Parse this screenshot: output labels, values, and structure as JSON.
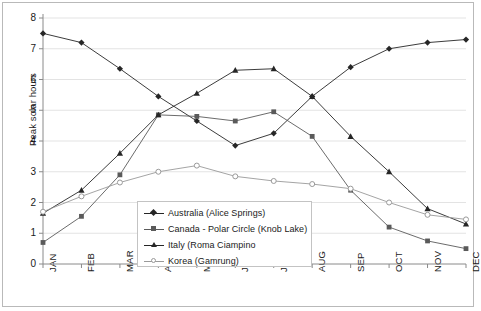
{
  "chart_data": {
    "type": "line",
    "title": "",
    "xlabel": "",
    "ylabel": "Peak solar hours",
    "categories": [
      "JAN",
      "FEB",
      "MAR",
      "APR",
      "MAY",
      "JUN",
      "JUL",
      "AUG",
      "SEP",
      "OCT",
      "NOV",
      "DEC"
    ],
    "ylim": [
      0,
      8
    ],
    "yticks": [
      0,
      1,
      2,
      3,
      4,
      5,
      6,
      7,
      8
    ],
    "grid": true,
    "legend_position": "inside-center-bottom",
    "series": [
      {
        "name": "Australia (Alice Springs)",
        "marker": "diamond",
        "color": "#262626",
        "values": [
          7.5,
          7.2,
          6.35,
          5.45,
          4.65,
          3.85,
          4.25,
          5.45,
          6.4,
          7.0,
          7.2,
          7.3
        ]
      },
      {
        "name": "Canada - Polar Circle (Knob Lake)",
        "marker": "square",
        "color": "#5a5a5a",
        "values": [
          0.7,
          1.55,
          2.9,
          4.85,
          4.8,
          4.65,
          4.95,
          4.15,
          2.4,
          1.2,
          0.75,
          0.5
        ]
      },
      {
        "name": "Italy (Roma Ciampino)",
        "marker": "triangle",
        "color": "#262626",
        "values": [
          1.65,
          2.4,
          3.6,
          4.85,
          5.55,
          6.3,
          6.35,
          5.45,
          4.15,
          3.0,
          1.8,
          1.3
        ]
      },
      {
        "name": "Korea (Gamrung)",
        "marker": "circle",
        "color": "#9a9a9a",
        "values": [
          1.7,
          2.2,
          2.65,
          3.0,
          3.2,
          2.85,
          2.7,
          2.6,
          2.45,
          2.0,
          1.6,
          1.45
        ]
      }
    ]
  },
  "legend": {
    "items": [
      {
        "label": "Australia (Alice Springs)"
      },
      {
        "label": "Canada - Polar Circle (Knob Lake)"
      },
      {
        "label": "Italy (Roma Ciampino"
      },
      {
        "label": "Korea (Gamrung)"
      }
    ]
  },
  "colors": {
    "axis": "#8a8a8a",
    "grid": "#e3e3e3",
    "frame": "#b9b9b9",
    "series_dark": "#262626",
    "series_mid": "#5a5a5a",
    "series_light": "#9a9a9a"
  }
}
